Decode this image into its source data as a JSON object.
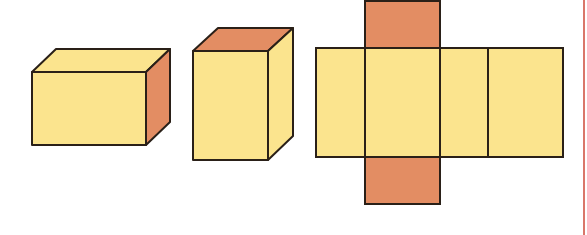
{
  "figure": {
    "colors": {
      "face_light": "#fbe48e",
      "face_dark": "#e38d63",
      "stroke": "#2a2018",
      "margin_line": "#d9776a",
      "background": "#ffffff"
    },
    "shapes": [
      {
        "name": "cuboid-landscape",
        "shaded_face": "right side"
      },
      {
        "name": "cuboid-portrait",
        "shaded_face": "top"
      },
      {
        "name": "cuboid-net",
        "faces": 6,
        "shaded_faces": [
          "top flap",
          "bottom flap"
        ]
      }
    ]
  }
}
